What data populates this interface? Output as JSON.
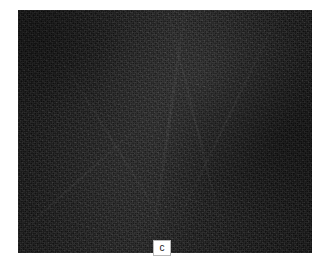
{
  "figure": {
    "panel_letter": "c",
    "background_color": "#ffffff",
    "plate": {
      "base_color": "#161616",
      "description_icon": "dark-noise-texture",
      "left": 18,
      "top": 10,
      "width": 294,
      "height": 243
    },
    "label_box": {
      "text": "c",
      "background_color": "#ffffff",
      "border_color": "#b9b9b9",
      "text_color": "#1a1a1a"
    }
  }
}
